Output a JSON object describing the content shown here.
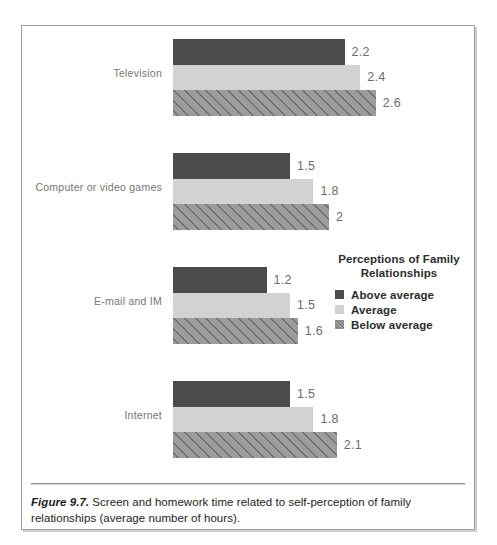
{
  "figure": {
    "caption_label": "Figure 9.7.",
    "caption_text": " Screen and homework time related to self-perception of family relationships (average number of hours)."
  },
  "legend": {
    "title_line1": "Perceptions of Family",
    "title_line2": "Relationships",
    "items": [
      {
        "label": "Above average",
        "color": "#4b4b4b",
        "pattern": "solid"
      },
      {
        "label": "Average",
        "color": "#d2d2d2",
        "pattern": "solid"
      },
      {
        "label": "Below average",
        "color": "#9c9c9c",
        "pattern": "diagonal-hatch"
      }
    ]
  },
  "chart_data": {
    "type": "bar",
    "orientation": "horizontal",
    "title": "",
    "xlabel": "",
    "ylabel": "",
    "categories": [
      "Television",
      "Computer or video games",
      "E-mail and IM",
      "Internet"
    ],
    "series": [
      {
        "name": "Above average",
        "values": [
          2.2,
          1.5,
          1.2,
          1.5
        ]
      },
      {
        "name": "Average",
        "values": [
          2.4,
          1.8,
          1.5,
          1.8
        ]
      },
      {
        "name": "Below average",
        "values": [
          2.6,
          2,
          1.6,
          2.1
        ]
      }
    ],
    "value_labels": [
      [
        "2.2",
        "2.4",
        "2.6"
      ],
      [
        "1.5",
        "1.8",
        "2"
      ],
      [
        "1.2",
        "1.5",
        "1.6"
      ],
      [
        "1.5",
        "1.8",
        "2.1"
      ]
    ],
    "xlim": [
      0,
      2.6
    ],
    "grid": false,
    "legend_position": "middle-right",
    "units": "average number of hours"
  }
}
